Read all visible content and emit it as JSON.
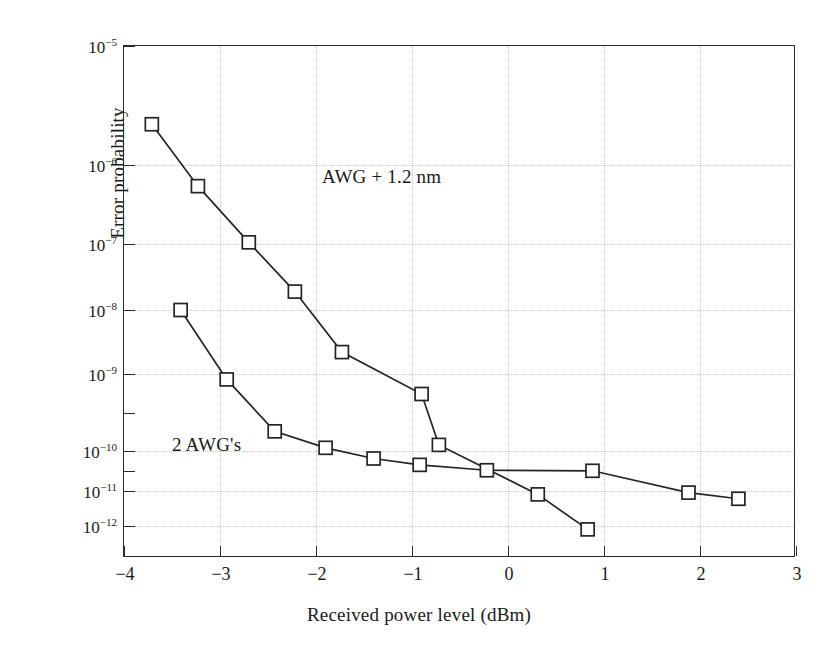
{
  "chart_data": {
    "type": "line",
    "title": "",
    "xlabel": "Received power level (dBm)",
    "ylabel": "Error probability",
    "xlim": [
      -4,
      3
    ],
    "ylim": [
      1e-12,
      1e-05
    ],
    "yscale": "log",
    "grid": true,
    "legend_position": "inside-annotations",
    "xticks": [
      -4,
      -3,
      -2,
      -1,
      0,
      1,
      2,
      3
    ],
    "xtick_labels": [
      "−4",
      "−3",
      "−2",
      "−1",
      "0",
      "1",
      "2",
      "3"
    ],
    "yticks": [
      1e-05,
      1e-06,
      1e-07,
      1e-08,
      1e-09,
      1e-10,
      1e-11,
      1e-12
    ],
    "ytick_labels": [
      "10−5",
      "10−6",
      "10−7",
      "10−8",
      "10−9",
      "10−10",
      "10−11",
      "10−12"
    ],
    "ytick_mantissas": [
      "10",
      "10",
      "10",
      "10",
      "10",
      "10",
      "10",
      "10"
    ],
    "ytick_exponents": [
      "−5",
      "−6",
      "−7",
      "−8",
      "−9",
      "−10",
      "−11",
      "−12"
    ],
    "ytick_pixel_positions": [
      0,
      119,
      198,
      264,
      328,
      405,
      445,
      480
    ],
    "series": [
      {
        "name": "AWG + 1.2 nm",
        "marker": "square-open",
        "color": "#242424",
        "points": [
          {
            "x": -3.71,
            "y": 2.2e-06
          },
          {
            "x": -3.23,
            "y": 5.4e-07
          },
          {
            "x": -2.7,
            "y": 1.05e-07
          },
          {
            "x": -2.22,
            "y": 1.9e-08
          },
          {
            "x": -1.73,
            "y": 2.2e-09
          },
          {
            "x": -0.9,
            "y": 5.5e-10
          },
          {
            "x": -0.72,
            "y": 1.2e-10
          },
          {
            "x": 0.31,
            "y": 8e-12
          },
          {
            "x": 0.83,
            "y": 8e-13
          }
        ]
      },
      {
        "name": "2 AWG's",
        "marker": "square-open",
        "color": "#242424",
        "points": [
          {
            "x": -3.41,
            "y": 1e-08
          },
          {
            "x": -2.93,
            "y": 8.5e-10
          },
          {
            "x": -2.43,
            "y": 1.8e-10
          },
          {
            "x": -1.9,
            "y": 1.1e-10
          },
          {
            "x": -1.4,
            "y": 6.5e-11
          },
          {
            "x": -0.92,
            "y": 4.5e-11
          },
          {
            "x": -0.22,
            "y": 3.3e-11
          },
          {
            "x": 0.88,
            "y": 3.2e-11
          },
          {
            "x": 1.88,
            "y": 9e-12
          },
          {
            "x": 2.4,
            "y": 6e-12
          }
        ]
      }
    ],
    "annotations": [
      {
        "text": "AWG + 1.2 nm",
        "x_px": 198,
        "y_px": 120
      },
      {
        "text": "2 AWG's",
        "x_px": 48,
        "y_px": 388
      }
    ]
  }
}
